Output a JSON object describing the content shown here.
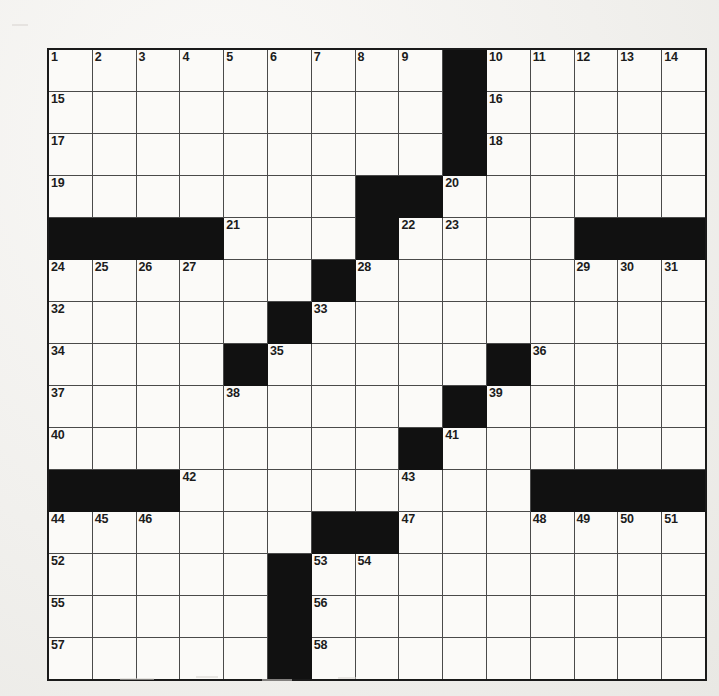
{
  "puzzle": {
    "kind": "crossword-grid",
    "rows": 15,
    "columns": 15,
    "colors": {
      "block": "#111111",
      "cell": "#fbfaf8",
      "grid_line": "#4a4a4a",
      "outer_border": "#1a1a1a",
      "number_text": "#1c1c1c",
      "page_background": "#f2f1ef"
    },
    "highest_number": 58,
    "grid": [
      [
        {
          "block": false,
          "number": "1"
        },
        {
          "block": false,
          "number": "2"
        },
        {
          "block": false,
          "number": "3"
        },
        {
          "block": false,
          "number": "4"
        },
        {
          "block": false,
          "number": "5"
        },
        {
          "block": false,
          "number": "6"
        },
        {
          "block": false,
          "number": "7"
        },
        {
          "block": false,
          "number": "8"
        },
        {
          "block": false,
          "number": "9"
        },
        {
          "block": true,
          "number": ""
        },
        {
          "block": false,
          "number": "10"
        },
        {
          "block": false,
          "number": "11"
        },
        {
          "block": false,
          "number": "12"
        },
        {
          "block": false,
          "number": "13"
        },
        {
          "block": false,
          "number": "14"
        }
      ],
      [
        {
          "block": false,
          "number": "15"
        },
        {
          "block": false,
          "number": ""
        },
        {
          "block": false,
          "number": ""
        },
        {
          "block": false,
          "number": ""
        },
        {
          "block": false,
          "number": ""
        },
        {
          "block": false,
          "number": ""
        },
        {
          "block": false,
          "number": ""
        },
        {
          "block": false,
          "number": ""
        },
        {
          "block": false,
          "number": ""
        },
        {
          "block": true,
          "number": ""
        },
        {
          "block": false,
          "number": "16"
        },
        {
          "block": false,
          "number": ""
        },
        {
          "block": false,
          "number": ""
        },
        {
          "block": false,
          "number": ""
        },
        {
          "block": false,
          "number": ""
        }
      ],
      [
        {
          "block": false,
          "number": "17"
        },
        {
          "block": false,
          "number": ""
        },
        {
          "block": false,
          "number": ""
        },
        {
          "block": false,
          "number": ""
        },
        {
          "block": false,
          "number": ""
        },
        {
          "block": false,
          "number": ""
        },
        {
          "block": false,
          "number": ""
        },
        {
          "block": false,
          "number": ""
        },
        {
          "block": false,
          "number": ""
        },
        {
          "block": true,
          "number": ""
        },
        {
          "block": false,
          "number": "18"
        },
        {
          "block": false,
          "number": ""
        },
        {
          "block": false,
          "number": ""
        },
        {
          "block": false,
          "number": ""
        },
        {
          "block": false,
          "number": ""
        }
      ],
      [
        {
          "block": false,
          "number": "19"
        },
        {
          "block": false,
          "number": ""
        },
        {
          "block": false,
          "number": ""
        },
        {
          "block": false,
          "number": ""
        },
        {
          "block": false,
          "number": ""
        },
        {
          "block": false,
          "number": ""
        },
        {
          "block": false,
          "number": ""
        },
        {
          "block": true,
          "number": ""
        },
        {
          "block": true,
          "number": ""
        },
        {
          "block": false,
          "number": "20"
        },
        {
          "block": false,
          "number": ""
        },
        {
          "block": false,
          "number": ""
        },
        {
          "block": false,
          "number": ""
        },
        {
          "block": false,
          "number": ""
        },
        {
          "block": false,
          "number": ""
        }
      ],
      [
        {
          "block": true,
          "number": ""
        },
        {
          "block": true,
          "number": ""
        },
        {
          "block": true,
          "number": ""
        },
        {
          "block": true,
          "number": ""
        },
        {
          "block": false,
          "number": "21"
        },
        {
          "block": false,
          "number": ""
        },
        {
          "block": false,
          "number": ""
        },
        {
          "block": true,
          "number": ""
        },
        {
          "block": false,
          "number": "22"
        },
        {
          "block": false,
          "number": "23"
        },
        {
          "block": false,
          "number": ""
        },
        {
          "block": false,
          "number": ""
        },
        {
          "block": true,
          "number": ""
        },
        {
          "block": true,
          "number": ""
        },
        {
          "block": true,
          "number": ""
        }
      ],
      [
        {
          "block": false,
          "number": "24"
        },
        {
          "block": false,
          "number": "25"
        },
        {
          "block": false,
          "number": "26"
        },
        {
          "block": false,
          "number": "27"
        },
        {
          "block": false,
          "number": ""
        },
        {
          "block": false,
          "number": ""
        },
        {
          "block": true,
          "number": ""
        },
        {
          "block": false,
          "number": "28"
        },
        {
          "block": false,
          "number": ""
        },
        {
          "block": false,
          "number": ""
        },
        {
          "block": false,
          "number": ""
        },
        {
          "block": false,
          "number": ""
        },
        {
          "block": false,
          "number": "29"
        },
        {
          "block": false,
          "number": "30"
        },
        {
          "block": false,
          "number": "31"
        }
      ],
      [
        {
          "block": false,
          "number": "32"
        },
        {
          "block": false,
          "number": ""
        },
        {
          "block": false,
          "number": ""
        },
        {
          "block": false,
          "number": ""
        },
        {
          "block": false,
          "number": ""
        },
        {
          "block": true,
          "number": ""
        },
        {
          "block": false,
          "number": "33"
        },
        {
          "block": false,
          "number": ""
        },
        {
          "block": false,
          "number": ""
        },
        {
          "block": false,
          "number": ""
        },
        {
          "block": false,
          "number": ""
        },
        {
          "block": false,
          "number": ""
        },
        {
          "block": false,
          "number": ""
        },
        {
          "block": false,
          "number": ""
        },
        {
          "block": false,
          "number": ""
        }
      ],
      [
        {
          "block": false,
          "number": "34"
        },
        {
          "block": false,
          "number": ""
        },
        {
          "block": false,
          "number": ""
        },
        {
          "block": false,
          "number": ""
        },
        {
          "block": true,
          "number": ""
        },
        {
          "block": false,
          "number": "35"
        },
        {
          "block": false,
          "number": ""
        },
        {
          "block": false,
          "number": ""
        },
        {
          "block": false,
          "number": ""
        },
        {
          "block": false,
          "number": ""
        },
        {
          "block": true,
          "number": ""
        },
        {
          "block": false,
          "number": "36"
        },
        {
          "block": false,
          "number": ""
        },
        {
          "block": false,
          "number": ""
        },
        {
          "block": false,
          "number": ""
        }
      ],
      [
        {
          "block": false,
          "number": "37"
        },
        {
          "block": false,
          "number": ""
        },
        {
          "block": false,
          "number": ""
        },
        {
          "block": false,
          "number": ""
        },
        {
          "block": false,
          "number": "38"
        },
        {
          "block": false,
          "number": ""
        },
        {
          "block": false,
          "number": ""
        },
        {
          "block": false,
          "number": ""
        },
        {
          "block": false,
          "number": ""
        },
        {
          "block": true,
          "number": ""
        },
        {
          "block": false,
          "number": "39"
        },
        {
          "block": false,
          "number": ""
        },
        {
          "block": false,
          "number": ""
        },
        {
          "block": false,
          "number": ""
        },
        {
          "block": false,
          "number": ""
        }
      ],
      [
        {
          "block": false,
          "number": "40"
        },
        {
          "block": false,
          "number": ""
        },
        {
          "block": false,
          "number": ""
        },
        {
          "block": false,
          "number": ""
        },
        {
          "block": false,
          "number": ""
        },
        {
          "block": false,
          "number": ""
        },
        {
          "block": false,
          "number": ""
        },
        {
          "block": false,
          "number": ""
        },
        {
          "block": true,
          "number": ""
        },
        {
          "block": false,
          "number": "41"
        },
        {
          "block": false,
          "number": ""
        },
        {
          "block": false,
          "number": ""
        },
        {
          "block": false,
          "number": ""
        },
        {
          "block": false,
          "number": ""
        },
        {
          "block": false,
          "number": ""
        }
      ],
      [
        {
          "block": true,
          "number": ""
        },
        {
          "block": true,
          "number": ""
        },
        {
          "block": true,
          "number": ""
        },
        {
          "block": false,
          "number": "42"
        },
        {
          "block": false,
          "number": ""
        },
        {
          "block": false,
          "number": ""
        },
        {
          "block": false,
          "number": ""
        },
        {
          "block": false,
          "number": ""
        },
        {
          "block": false,
          "number": "43"
        },
        {
          "block": false,
          "number": ""
        },
        {
          "block": false,
          "number": ""
        },
        {
          "block": true,
          "number": ""
        },
        {
          "block": true,
          "number": ""
        },
        {
          "block": true,
          "number": ""
        },
        {
          "block": true,
          "number": ""
        }
      ],
      [
        {
          "block": false,
          "number": "44"
        },
        {
          "block": false,
          "number": "45"
        },
        {
          "block": false,
          "number": "46"
        },
        {
          "block": false,
          "number": ""
        },
        {
          "block": false,
          "number": ""
        },
        {
          "block": false,
          "number": ""
        },
        {
          "block": true,
          "number": ""
        },
        {
          "block": true,
          "number": ""
        },
        {
          "block": false,
          "number": "47"
        },
        {
          "block": false,
          "number": ""
        },
        {
          "block": false,
          "number": ""
        },
        {
          "block": false,
          "number": "48"
        },
        {
          "block": false,
          "number": "49"
        },
        {
          "block": false,
          "number": "50"
        },
        {
          "block": false,
          "number": "51"
        }
      ],
      [
        {
          "block": false,
          "number": "52"
        },
        {
          "block": false,
          "number": ""
        },
        {
          "block": false,
          "number": ""
        },
        {
          "block": false,
          "number": ""
        },
        {
          "block": false,
          "number": ""
        },
        {
          "block": true,
          "number": ""
        },
        {
          "block": false,
          "number": "53"
        },
        {
          "block": false,
          "number": "54"
        },
        {
          "block": false,
          "number": ""
        },
        {
          "block": false,
          "number": ""
        },
        {
          "block": false,
          "number": ""
        },
        {
          "block": false,
          "number": ""
        },
        {
          "block": false,
          "number": ""
        },
        {
          "block": false,
          "number": ""
        },
        {
          "block": false,
          "number": ""
        }
      ],
      [
        {
          "block": false,
          "number": "55"
        },
        {
          "block": false,
          "number": ""
        },
        {
          "block": false,
          "number": ""
        },
        {
          "block": false,
          "number": ""
        },
        {
          "block": false,
          "number": ""
        },
        {
          "block": true,
          "number": ""
        },
        {
          "block": false,
          "number": "56"
        },
        {
          "block": false,
          "number": ""
        },
        {
          "block": false,
          "number": ""
        },
        {
          "block": false,
          "number": ""
        },
        {
          "block": false,
          "number": ""
        },
        {
          "block": false,
          "number": ""
        },
        {
          "block": false,
          "number": ""
        },
        {
          "block": false,
          "number": ""
        },
        {
          "block": false,
          "number": ""
        }
      ],
      [
        {
          "block": false,
          "number": "57"
        },
        {
          "block": false,
          "number": ""
        },
        {
          "block": false,
          "number": ""
        },
        {
          "block": false,
          "number": ""
        },
        {
          "block": false,
          "number": ""
        },
        {
          "block": true,
          "number": ""
        },
        {
          "block": false,
          "number": "58"
        },
        {
          "block": false,
          "number": ""
        },
        {
          "block": false,
          "number": ""
        },
        {
          "block": false,
          "number": ""
        },
        {
          "block": false,
          "number": ""
        },
        {
          "block": false,
          "number": ""
        },
        {
          "block": false,
          "number": ""
        },
        {
          "block": false,
          "number": ""
        },
        {
          "block": false,
          "number": ""
        }
      ]
    ]
  }
}
